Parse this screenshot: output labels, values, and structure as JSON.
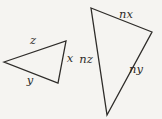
{
  "diagram": {
    "background_color": "#f5f4f1",
    "stroke_color": "#2e2c29",
    "small_triangle": {
      "points": "4,62 66,41 58,83",
      "labels": {
        "top_side": "z",
        "bottom_side": "y",
        "right_side": "x"
      }
    },
    "large_triangle": {
      "points": "91,8 152,32 107,115",
      "labels": {
        "top_side": "nx",
        "left_side": "nz",
        "right_side": "ny"
      }
    }
  }
}
